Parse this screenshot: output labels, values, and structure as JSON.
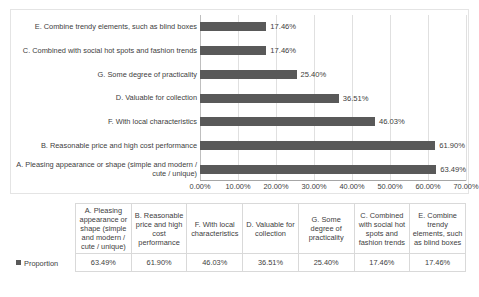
{
  "chart_data": {
    "type": "bar",
    "orientation": "horizontal",
    "title": "",
    "xlabel": "",
    "ylabel": "",
    "xlim": [
      0,
      0.7
    ],
    "grid": true,
    "legend_position": "table-row-header",
    "series_name": "Proportion",
    "bar_color": "#595959",
    "categories": [
      "E. Combine trendy elements, such as blind boxes",
      "C. Combined with social hot spots and fashion trends",
      "G. Some degree of practicality",
      "D. Valuable for collection",
      "F. With local characteristics",
      "B. Reasonable price and high cost performance",
      "A. Pleasing appearance or shape (simple and modern / cute / unique)"
    ],
    "values": [
      17.46,
      17.46,
      25.4,
      36.51,
      46.03,
      61.9,
      63.49
    ],
    "value_labels": [
      "17.46%",
      "17.46%",
      "25.40%",
      "36.51%",
      "46.03%",
      "61.90%",
      "63.49%"
    ],
    "x_ticks": [
      0,
      10,
      20,
      30,
      40,
      50,
      60,
      70
    ],
    "x_tick_labels": [
      "0.00%",
      "10.00%",
      "20.00%",
      "30.00%",
      "40.00%",
      "50.00%",
      "60.00%",
      "70.00%"
    ]
  },
  "chart": {
    "bars": [
      {
        "label": "E. Combine trendy elements, such as blind boxes",
        "value_label": "17.46%",
        "value": 17.46
      },
      {
        "label": "C. Combined with social hot spots and fashion trends",
        "value_label": "17.46%",
        "value": 17.46
      },
      {
        "label": "G. Some degree of practicality",
        "value_label": "25.40%",
        "value": 25.4
      },
      {
        "label": "D. Valuable for collection",
        "value_label": "36.51%",
        "value": 36.51
      },
      {
        "label": "F. With local characteristics",
        "value_label": "46.03%",
        "value": 46.03
      },
      {
        "label": "B. Reasonable price and high cost performance",
        "value_label": "61.90%",
        "value": 61.9
      },
      {
        "label": "A. Pleasing appearance or shape (simple and modern / cute / unique)",
        "value_label": "63.49%",
        "value": 63.49
      }
    ],
    "x_tick_labels": [
      "0.00%",
      "10.00%",
      "20.00%",
      "30.00%",
      "40.00%",
      "50.00%",
      "60.00%",
      "70.00%"
    ]
  },
  "table": {
    "legend_label": "Proportion",
    "columns": [
      "A. Pleasing appearance or shape (simple and modern / cute / unique)",
      "B. Reasonable price and high cost performance",
      "F. With local characteristics",
      "D. Valuable for collection",
      "G. Some degree of practicality",
      "C. Combined with social hot spots and fashion trends",
      "E. Combine trendy elements, such as blind boxes"
    ],
    "values": [
      "63.49%",
      "61.90%",
      "46.03%",
      "36.51%",
      "25.40%",
      "17.46%",
      "17.46%"
    ]
  }
}
